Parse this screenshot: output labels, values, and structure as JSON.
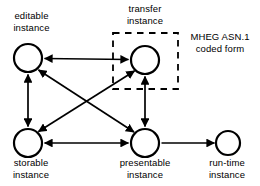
{
  "diagram": {
    "type": "state-relationship-diagram",
    "canvas": {
      "width": 260,
      "height": 186,
      "background": "#ffffff"
    },
    "stroke_color": "#000000",
    "nodes": [
      {
        "id": "editable",
        "label_line1": "editable",
        "label_line2": "instance",
        "cx": 28,
        "cy": 58,
        "r": 14,
        "label_position": "above"
      },
      {
        "id": "transfer",
        "label_line1": "transfer",
        "label_line2": "instance",
        "cx": 145,
        "cy": 60,
        "r": 14,
        "label_position": "above"
      },
      {
        "id": "storable",
        "label_line1": "storable",
        "label_line2": "instance",
        "cx": 28,
        "cy": 143,
        "r": 14,
        "label_position": "below"
      },
      {
        "id": "presentable",
        "label_line1": "presentable",
        "label_line2": "instance",
        "cx": 145,
        "cy": 143,
        "r": 14,
        "label_position": "below"
      },
      {
        "id": "runtime",
        "label_line1": "run-time",
        "label_line2": "instance",
        "cx": 228,
        "cy": 143,
        "r": 12,
        "label_position": "below"
      }
    ],
    "edges": [
      {
        "id": "editable-transfer",
        "from": "editable",
        "to": "transfer",
        "arrows": "both"
      },
      {
        "id": "editable-storable",
        "from": "editable",
        "to": "storable",
        "arrows": "both"
      },
      {
        "id": "transfer-presentable",
        "from": "transfer",
        "to": "presentable",
        "arrows": "both"
      },
      {
        "id": "storable-presentable",
        "from": "storable",
        "to": "presentable",
        "arrows": "both"
      },
      {
        "id": "editable-presentable",
        "from": "editable",
        "to": "presentable",
        "arrows": "both"
      },
      {
        "id": "storable-transfer",
        "from": "storable",
        "to": "transfer",
        "arrows": "both"
      },
      {
        "id": "presentable-runtime",
        "from": "presentable",
        "to": "runtime",
        "arrows": "end"
      }
    ],
    "annotation_box": {
      "id": "mheg-asn1-box",
      "style": "dashed",
      "x": 113,
      "y": 33,
      "width": 65,
      "height": 56
    },
    "annotation_label": {
      "id": "mheg-asn1-label",
      "line1": "MHEG ASN.1",
      "line2": "coded form",
      "x": 182,
      "y": 30
    }
  }
}
